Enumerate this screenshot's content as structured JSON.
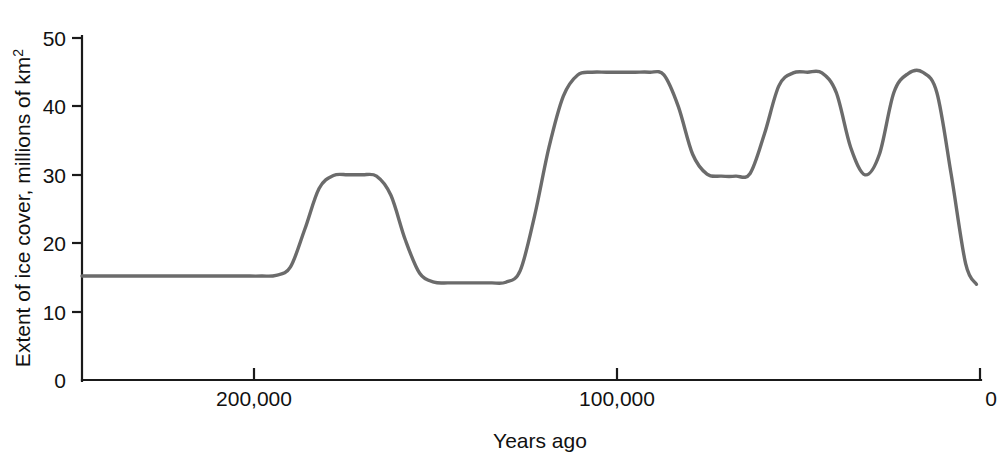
{
  "chart_data": {
    "type": "line",
    "title": "",
    "xlabel": "Years ago",
    "ylabel": "Extent of ice cover, millions of km2",
    "ylabel_main": "Extent of ice cover, millions of km",
    "ylabel_exponent": "2",
    "xlim": [
      250000,
      0
    ],
    "ylim": [
      0,
      50
    ],
    "grid": false,
    "legend": "none",
    "line_color": "#6b6b6b",
    "axis_color": "#1a1a1a",
    "x_ticks": [
      {
        "value": 200000,
        "label": "200,000"
      },
      {
        "value": 100000,
        "label": "100,000"
      },
      {
        "value": 0,
        "label": "0"
      }
    ],
    "y_ticks": [
      {
        "value": 0,
        "label": "0"
      },
      {
        "value": 10,
        "label": "10"
      },
      {
        "value": 20,
        "label": "20"
      },
      {
        "value": 30,
        "label": "30"
      },
      {
        "value": 40,
        "label": "40"
      },
      {
        "value": 50,
        "label": "50"
      }
    ],
    "x": [
      250000,
      235000,
      220000,
      210000,
      205000,
      200000,
      196000,
      192000,
      188000,
      184000,
      180000,
      176000,
      172000,
      168000,
      164000,
      160000,
      156000,
      152000,
      148000,
      144000,
      140000,
      136000,
      132000,
      128000,
      124000,
      120000,
      116000,
      112000,
      108000,
      104000,
      100000,
      96000,
      92000,
      88000,
      84000,
      80000,
      76000,
      72000,
      68000,
      64000,
      60000,
      56000,
      52000,
      48000,
      44000,
      40000,
      36000,
      32000,
      28000,
      24000,
      20000,
      16000,
      12000,
      8000,
      4000,
      1000
    ],
    "y": [
      15.2,
      15.2,
      15.2,
      15.2,
      15.2,
      15.2,
      15.3,
      16.5,
      22.0,
      28.0,
      29.9,
      30.0,
      30.0,
      29.8,
      27.0,
      20.5,
      15.6,
      14.3,
      14.2,
      14.2,
      14.2,
      14.2,
      14.3,
      16.0,
      24.0,
      34.0,
      41.5,
      44.6,
      45.0,
      45.0,
      45.0,
      45.0,
      45.0,
      44.6,
      40.0,
      33.0,
      30.1,
      29.8,
      29.8,
      30.2,
      36.0,
      43.0,
      44.9,
      45.0,
      44.9,
      42.0,
      34.0,
      30.0,
      33.0,
      42.0,
      44.8,
      45.0,
      42.0,
      30.0,
      17.0,
      14.0
    ],
    "annotations": [
      {
        "text": "baseline ice extent",
        "value": 15.2
      },
      {
        "text": "interglacial minimum",
        "value": 14.2
      },
      {
        "text": "glacial maximum plateau",
        "value": 45.0
      },
      {
        "text": "present-day extent",
        "value": 14.0
      }
    ]
  }
}
